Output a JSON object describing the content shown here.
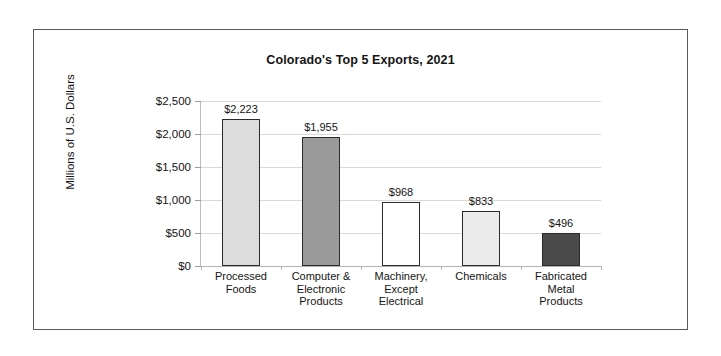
{
  "chart_data": {
    "type": "bar",
    "title": "Colorado's Top 5 Exports, 2021",
    "xlabel": "",
    "ylabel": "Millions of U.S. Dollars",
    "ylim": [
      0,
      2500
    ],
    "ytick_labels": [
      "$2,500",
      "$2,000",
      "$1,500",
      "$1,000",
      "$500",
      "$0"
    ],
    "ytick_values": [
      2500,
      2000,
      1500,
      1000,
      500,
      0
    ],
    "grid": true,
    "legend": "none",
    "categories": [
      "Processed\nFoods",
      "Computer &\nElectronic\nProducts",
      "Machinery,\nExcept\nElectrical",
      "Chemicals",
      "Fabricated\nMetal\nProducts"
    ],
    "values": [
      2223,
      1955,
      968,
      833,
      496
    ],
    "data_labels": [
      "$2,223",
      "$1,955",
      "$968",
      "$833",
      "$496"
    ],
    "bar_colors": [
      "#dcdcdc",
      "#9a9a9a",
      "#ffffff",
      "#ebebeb",
      "#4a4a4a"
    ],
    "bar_edge_color": "#2b2b2b",
    "grid_color": "#d9d9d9",
    "text_color": "#141414"
  }
}
